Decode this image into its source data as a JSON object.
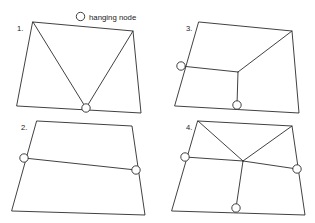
{
  "figure": {
    "background_color": "#ffffff",
    "line_color": "#2b2b2b",
    "marker_fill": "#ffffff",
    "legend": {
      "marker_name": "hanging-node-circle",
      "label": "hanging node",
      "marker": {
        "cx": 80.5,
        "cy": 16.5,
        "r": 4.2
      },
      "text_x": 89,
      "text_y": 19.5
    },
    "panels": [
      {
        "id": "panel-1",
        "number_label": "1.",
        "number_x": 17,
        "number_y": 31,
        "description": "quadrilateral split by two diagonals meeting at one hanging node on the bottom edge",
        "outline": [
          [
            33,
            22
          ],
          [
            133,
            31
          ],
          [
            141,
            113
          ],
          [
            17,
            106
          ]
        ],
        "interior_edges": [
          [
            [
              33,
              22
            ],
            [
              86,
              108
            ]
          ],
          [
            [
              133,
              31
            ],
            [
              86,
              108
            ]
          ]
        ],
        "hanging_nodes": [
          {
            "name": "hanging-node-bottom",
            "cx": 86,
            "cy": 108,
            "r": 4.2
          }
        ]
      },
      {
        "id": "panel-2",
        "number_label": "2.",
        "number_x": 21,
        "number_y": 130,
        "description": "quadrilateral split by one horizontal edge with hanging nodes on the left and right edges",
        "outline": [
          [
            37,
            121
          ],
          [
            132,
            126
          ],
          [
            145,
            215
          ],
          [
            12,
            211
          ]
        ],
        "interior_edges": [
          [
            [
              24,
              158
            ],
            [
              136,
              170
            ]
          ]
        ],
        "hanging_nodes": [
          {
            "name": "hanging-node-left",
            "cx": 24,
            "cy": 158,
            "r": 4.2
          },
          {
            "name": "hanging-node-right",
            "cx": 136,
            "cy": 170,
            "r": 4.2
          }
        ]
      },
      {
        "id": "panel-3",
        "number_label": "3.",
        "number_x": 186,
        "number_y": 31,
        "description": "quadrilateral split into three cells by a Y junction with hanging nodes on the left and bottom edges",
        "outline": [
          [
            199,
            22
          ],
          [
            292,
            31
          ],
          [
            299,
            113
          ],
          [
            175,
            106
          ]
        ],
        "interior_edges": [
          [
            [
              181,
              66
            ],
            [
              238,
              72
            ]
          ],
          [
            [
              238,
              72
            ],
            [
              292,
              31
            ]
          ],
          [
            [
              238,
              72
            ],
            [
              237,
              105
            ]
          ]
        ],
        "hanging_nodes": [
          {
            "name": "hanging-node-left",
            "cx": 181,
            "cy": 66,
            "r": 4.2
          },
          {
            "name": "hanging-node-bottom",
            "cx": 237,
            "cy": 105,
            "r": 4.2
          }
        ]
      },
      {
        "id": "panel-4",
        "number_label": "4.",
        "number_x": 186,
        "number_y": 130,
        "description": "quadrilateral split by two diagonals, a horizontal edge and a vertical stem meeting at a central node, with hanging nodes on the left, right and bottom edges",
        "outline": [
          [
            198,
            121
          ],
          [
            292,
            126
          ],
          [
            305,
            215
          ],
          [
            172,
            211
          ]
        ],
        "interior_edges": [
          [
            [
              198,
              121
            ],
            [
              243,
              161
            ]
          ],
          [
            [
              292,
              126
            ],
            [
              243,
              161
            ]
          ],
          [
            [
              185,
              157
            ],
            [
              243,
              161
            ]
          ],
          [
            [
              243,
              161
            ],
            [
              297,
              169
            ]
          ],
          [
            [
              243,
              161
            ],
            [
              236,
              208
            ]
          ]
        ],
        "hanging_nodes": [
          {
            "name": "hanging-node-left",
            "cx": 185,
            "cy": 157,
            "r": 4.2
          },
          {
            "name": "hanging-node-right",
            "cx": 297,
            "cy": 169,
            "r": 4.2
          },
          {
            "name": "hanging-node-bottom",
            "cx": 236,
            "cy": 208,
            "r": 4.2
          }
        ]
      }
    ]
  }
}
